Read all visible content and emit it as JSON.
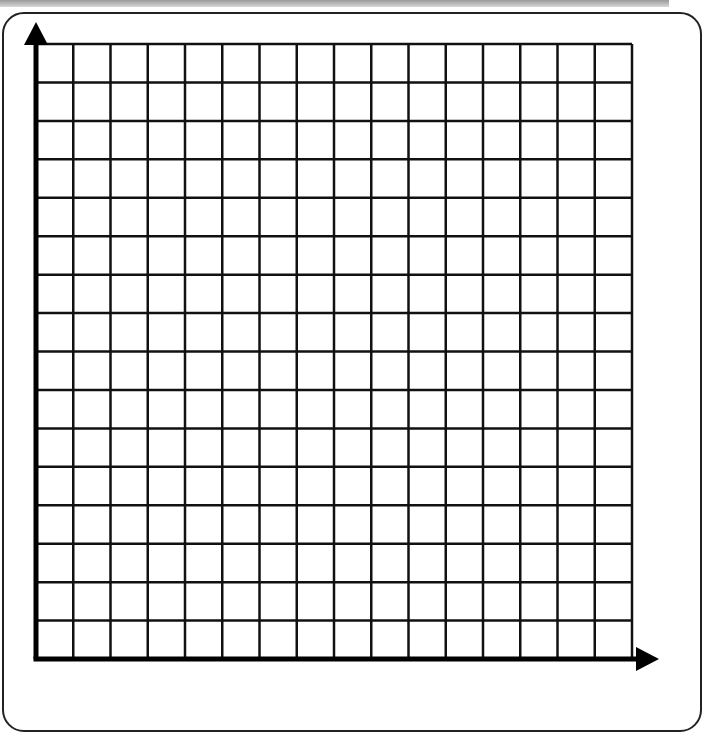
{
  "diagram": {
    "type": "blank-coordinate-grid",
    "columns": 16,
    "rows": 16,
    "grid": {
      "left": 36,
      "top": 44,
      "right": 632,
      "bottom": 659
    },
    "line_color": "#111111",
    "axis_color": "#000000",
    "x_axis": {
      "label": "",
      "arrow": true
    },
    "y_axis": {
      "label": "",
      "arrow": true
    }
  }
}
